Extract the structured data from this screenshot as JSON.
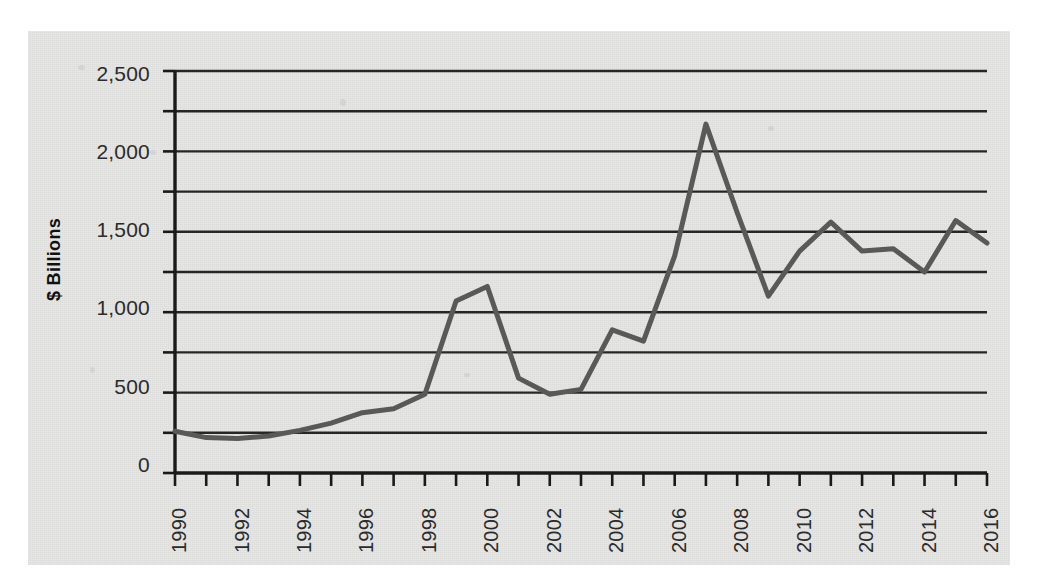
{
  "chart_data": {
    "type": "line",
    "title": "",
    "subtitle": "",
    "xlabel": "",
    "ylabel": "$ Billions",
    "grid": true,
    "legend": false,
    "legend_position": "none",
    "xlim": [
      1990,
      2016
    ],
    "ylim": [
      0,
      2500
    ],
    "y_major_step": 500,
    "y_minor_step": 250,
    "x_tick_step": 1,
    "x_label_step": 2,
    "line_color": "#595959",
    "line_width": 5,
    "x": [
      1990,
      1991,
      1992,
      1993,
      1994,
      1995,
      1996,
      1997,
      1998,
      1999,
      2000,
      2001,
      2002,
      2003,
      2004,
      2005,
      2006,
      2007,
      2008,
      2009,
      2010,
      2011,
      2012,
      2013,
      2014,
      2015,
      2016
    ],
    "values": [
      260,
      220,
      215,
      230,
      265,
      310,
      375,
      400,
      490,
      1070,
      1160,
      590,
      490,
      520,
      890,
      820,
      1350,
      2170,
      1620,
      1100,
      1380,
      1560,
      1380,
      1395,
      1250,
      1570,
      1430
    ],
    "ytick_labels": [
      "2,500",
      "2,000",
      "1,500",
      "1,000",
      "500",
      "0"
    ],
    "ytick_values": [
      2500,
      2000,
      1500,
      1000,
      500,
      0
    ],
    "xtick_labels": [
      "1990",
      "1992",
      "1994",
      "1996",
      "1998",
      "2000",
      "2002",
      "2004",
      "2006",
      "2008",
      "2010",
      "2012",
      "2014",
      "2016"
    ],
    "xtick_values": [
      1990,
      1992,
      1994,
      1996,
      1998,
      2000,
      2002,
      2004,
      2006,
      2008,
      2010,
      2012,
      2014,
      2016
    ],
    "colors": {
      "panel_background": "#e7e7e5",
      "page_background": "#ffffff",
      "axis": "#1a1a1a",
      "gridline": "#262626",
      "tick_text": "#2b2b2b",
      "axis_label": "#111111"
    }
  }
}
